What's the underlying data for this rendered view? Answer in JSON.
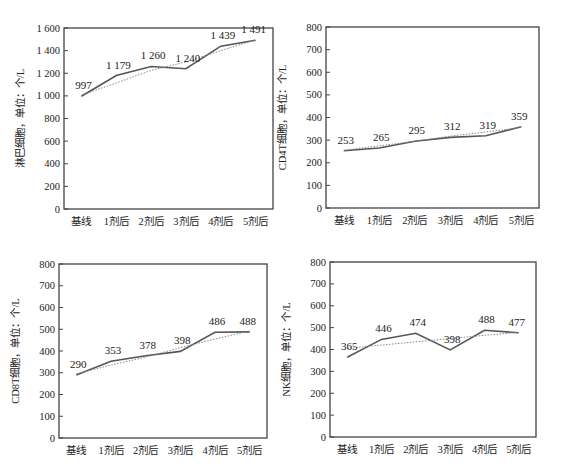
{
  "chart_data": [
    {
      "type": "line",
      "title": "",
      "xlabel": "",
      "ylabel": "淋巴细胞，单位：个/L",
      "categories": [
        "基线",
        "1剂后",
        "2剂后",
        "3剂后",
        "4剂后",
        "5剂后"
      ],
      "series": [
        {
          "name": "observed",
          "values": [
            997,
            1179,
            1260,
            1240,
            1439,
            1491
          ],
          "style": "solid"
        },
        {
          "name": "trend",
          "values": [
            1005,
            1115,
            1225,
            1300,
            1400,
            1495
          ],
          "style": "dotted"
        }
      ],
      "data_labels": [
        "997",
        "1 179",
        "1 260",
        "1 240",
        "1 439",
        "1 491"
      ],
      "yticks": [
        0,
        200,
        400,
        600,
        800,
        1000,
        1200,
        1400,
        1600
      ],
      "ytick_labels": [
        "0",
        "200",
        "400",
        "600",
        "800",
        "1 000",
        "1 200",
        "1 400",
        "1 600"
      ],
      "ylim": [
        0,
        1600
      ],
      "grid": false,
      "legend": "none",
      "box": {
        "left": 64,
        "top": 28,
        "right": 273,
        "bottom": 209
      }
    },
    {
      "type": "line",
      "title": "",
      "xlabel": "",
      "ylabel": "CD4T细胞，单位：个/L",
      "categories": [
        "基线",
        "1剂后",
        "2剂后",
        "3剂后",
        "4剂后",
        "5剂后"
      ],
      "series": [
        {
          "name": "observed",
          "values": [
            253,
            265,
            295,
            312,
            319,
            359
          ],
          "style": "solid"
        },
        {
          "name": "trend",
          "values": [
            255,
            275,
            295,
            318,
            336,
            356
          ],
          "style": "dotted"
        }
      ],
      "data_labels": [
        "253",
        "265",
        "295",
        "312",
        "319",
        "359"
      ],
      "yticks": [
        0,
        100,
        200,
        300,
        400,
        500,
        600,
        700,
        800
      ],
      "ytick_labels": [
        "0",
        "100",
        "200",
        "300",
        "400",
        "500",
        "600",
        "700",
        "800"
      ],
      "ylim": [
        0,
        800
      ],
      "grid": false,
      "legend": "none",
      "box": {
        "left": 326,
        "top": 27,
        "right": 539,
        "bottom": 208
      }
    },
    {
      "type": "line",
      "title": "",
      "xlabel": "",
      "ylabel": "CD8T细胞，单位：个/L",
      "categories": [
        "基线",
        "1剂后",
        "2剂后",
        "3剂后",
        "4剂后",
        "5剂后"
      ],
      "series": [
        {
          "name": "observed",
          "values": [
            290,
            353,
            378,
            398,
            486,
            488
          ],
          "style": "solid"
        },
        {
          "name": "trend",
          "values": [
            295,
            335,
            372,
            415,
            455,
            492
          ],
          "style": "dotted"
        }
      ],
      "data_labels": [
        "290",
        "353",
        "378",
        "398",
        "486",
        "488"
      ],
      "yticks": [
        0,
        100,
        200,
        300,
        400,
        500,
        600,
        700,
        800
      ],
      "ytick_labels": [
        "0",
        "100",
        "200",
        "300",
        "400",
        "500",
        "600",
        "700",
        "800"
      ],
      "ylim": [
        0,
        800
      ],
      "grid": false,
      "legend": "none",
      "box": {
        "left": 59,
        "top": 264,
        "right": 267,
        "bottom": 438
      }
    },
    {
      "type": "line",
      "title": "",
      "xlabel": "",
      "ylabel": "NK细胞，单位：个/L",
      "categories": [
        "基线",
        "1剂后",
        "2剂后",
        "3剂后",
        "4剂后",
        "5剂后"
      ],
      "series": [
        {
          "name": "observed",
          "values": [
            365,
            446,
            474,
            398,
            488,
            477
          ],
          "style": "solid"
        },
        {
          "name": "trend",
          "values": [
            405,
            420,
            435,
            450,
            465,
            478
          ],
          "style": "dotted"
        }
      ],
      "data_labels": [
        "365",
        "446",
        "474",
        "398",
        "488",
        "477"
      ],
      "yticks": [
        0,
        100,
        200,
        300,
        400,
        500,
        600,
        700,
        800
      ],
      "ytick_labels": [
        "0",
        "100",
        "200",
        "300",
        "400",
        "500",
        "600",
        "700",
        "800"
      ],
      "ylim": [
        0,
        800
      ],
      "grid": false,
      "legend": "none",
      "box": {
        "left": 330,
        "top": 262,
        "right": 536,
        "bottom": 437
      }
    }
  ],
  "colors": {
    "line": "#555555",
    "trend": "#888888",
    "axis": "#444444",
    "text": "#222222"
  }
}
